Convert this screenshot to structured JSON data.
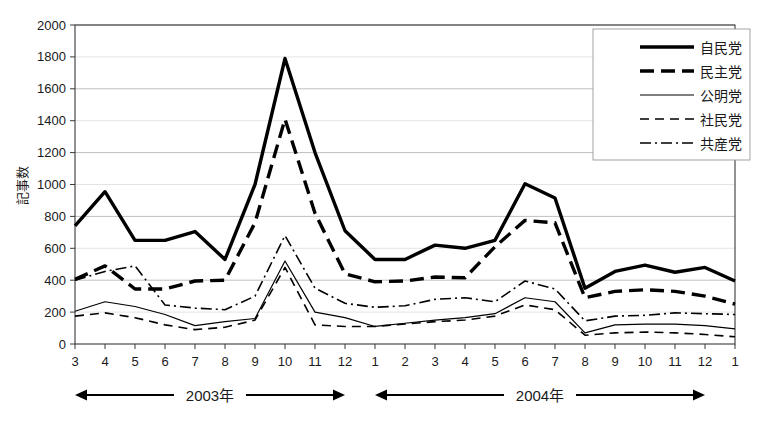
{
  "chart_data": {
    "type": "line",
    "title": "",
    "subtitle": "",
    "xlabel": "",
    "ylabel": "記事数",
    "ylim": [
      0,
      2000
    ],
    "ytick_step": 200,
    "yticks": [
      "0",
      "200",
      "400",
      "600",
      "800",
      "1000",
      "1200",
      "1400",
      "1600",
      "1800",
      "2000"
    ],
    "grid": true,
    "grid_axis": "y",
    "legend_position": "top-right",
    "categories": [
      "3",
      "4",
      "5",
      "6",
      "7",
      "8",
      "9",
      "10",
      "11",
      "12",
      "1",
      "2",
      "3",
      "4",
      "5",
      "6",
      "7",
      "8",
      "9",
      "10",
      "11",
      "12",
      "1"
    ],
    "x": [
      3,
      4,
      5,
      6,
      7,
      8,
      9,
      10,
      11,
      12,
      1,
      2,
      3,
      4,
      5,
      6,
      7,
      8,
      9,
      10,
      11,
      12,
      1
    ],
    "series": [
      {
        "name": "自民党",
        "style": "thick-solid",
        "color": "#000000",
        "width": 3.4,
        "dash": "none",
        "values": [
          740,
          955,
          650,
          650,
          705,
          530,
          1000,
          1790,
          1200,
          710,
          530,
          530,
          620,
          600,
          650,
          1005,
          915,
          350,
          455,
          495,
          450,
          480,
          395
        ]
      },
      {
        "name": "民主党",
        "style": "thick-dashed",
        "color": "#000000",
        "width": 3.4,
        "dash": "14,7",
        "values": [
          405,
          490,
          345,
          345,
          395,
          400,
          760,
          1410,
          820,
          440,
          390,
          395,
          420,
          415,
          610,
          775,
          760,
          290,
          330,
          340,
          330,
          300,
          250
        ]
      },
      {
        "name": "公明党",
        "style": "thin-solid",
        "color": "#000000",
        "width": 1.2,
        "dash": "none",
        "values": [
          205,
          265,
          235,
          185,
          115,
          140,
          160,
          520,
          200,
          165,
          110,
          130,
          150,
          165,
          190,
          290,
          265,
          70,
          120,
          125,
          125,
          115,
          95
        ]
      },
      {
        "name": "社民党",
        "style": "thin-dashed",
        "color": "#000000",
        "width": 1.6,
        "dash": "9,6",
        "values": [
          175,
          195,
          165,
          120,
          90,
          105,
          150,
          480,
          120,
          110,
          110,
          125,
          140,
          150,
          175,
          245,
          215,
          55,
          70,
          75,
          70,
          60,
          45
        ]
      },
      {
        "name": "共産党",
        "style": "dash-dot",
        "color": "#000000",
        "width": 1.6,
        "dash": "11,4,2,4",
        "values": [
          400,
          455,
          490,
          245,
          225,
          215,
          300,
          680,
          350,
          255,
          230,
          240,
          280,
          290,
          265,
          395,
          345,
          145,
          175,
          180,
          195,
          190,
          185
        ]
      }
    ],
    "spans": [
      {
        "label": "2003年",
        "from_index": 0,
        "to_index": 9
      },
      {
        "label": "2004年",
        "from_index": 10,
        "to_index": 21
      }
    ]
  }
}
